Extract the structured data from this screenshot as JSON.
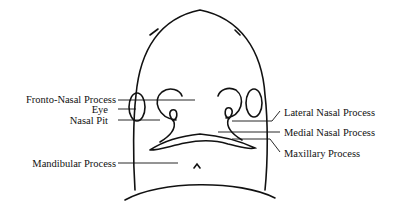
{
  "diagram": {
    "labels_left": [
      {
        "text": "Fronto-Nasal Process"
      },
      {
        "text": "Eye"
      },
      {
        "text": "Nasal Pit"
      },
      {
        "text": "Mandibular Process"
      }
    ],
    "labels_right": [
      {
        "text": "Lateral Nasal Process"
      },
      {
        "text": "Medial Nasal Process"
      },
      {
        "text": "Maxillary Process"
      }
    ]
  }
}
